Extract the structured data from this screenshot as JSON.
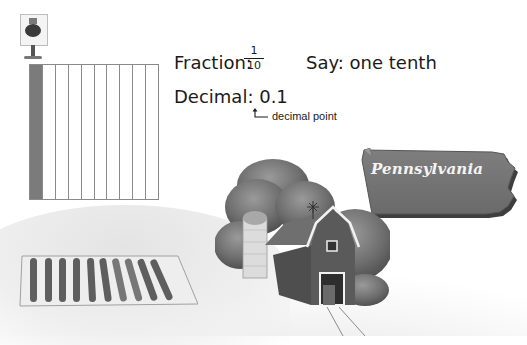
{
  "scene": {
    "title": "Fractions and decimals: one tenth",
    "region_label": "Pennsylvania"
  },
  "grid": {
    "total_parts": 10,
    "shaded_parts": 1,
    "shaded_color": "#7b7b7b",
    "line_color": "#8a8a8a"
  },
  "fraction": {
    "label": "Fraction:",
    "numerator": "1",
    "denominator": "10"
  },
  "say": {
    "label": "Say: one tenth"
  },
  "decimal": {
    "label": "Decimal: 0.1",
    "annotation": "decimal point"
  },
  "icons": {
    "sign": "tomato-sign-icon",
    "barn": "barn-illustration",
    "field": "crop-field-illustration",
    "state": "pennsylvania-map-shape"
  }
}
